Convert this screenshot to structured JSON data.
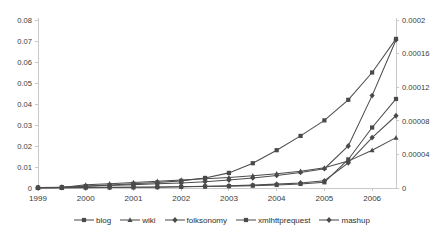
{
  "chart_data": {
    "type": "line",
    "title": "",
    "subtitle": "",
    "xlabel": "",
    "ylabel": "",
    "y2label": "",
    "grid": false,
    "legend_position": "bottom",
    "x": [
      1999,
      1999.5,
      2000,
      2000.5,
      2001,
      2001.5,
      2002,
      2002.5,
      2003,
      2003.5,
      2004,
      2004.5,
      2005,
      2005.5,
      2006,
      2006.5
    ],
    "xlim": [
      1999,
      2006.5
    ],
    "xticks": [
      1999,
      2000,
      2001,
      2002,
      2003,
      2004,
      2005,
      2006
    ],
    "xticklabels": [
      "1999",
      "2000",
      "2001",
      "2002",
      "2003",
      "2004",
      "2005",
      "2006"
    ],
    "ylim": [
      0,
      0.08
    ],
    "yticks": [
      0,
      0.01,
      0.02,
      0.03,
      0.04,
      0.05,
      0.06,
      0.07,
      0.08
    ],
    "yticklabels": [
      "0",
      "0.01",
      "0.02",
      "0.03",
      "0.04",
      "0.05",
      "0.06",
      "0.07",
      "0.08"
    ],
    "y2lim": [
      0,
      0.0002
    ],
    "y2ticks": [
      0,
      4e-05,
      8e-05,
      0.00012,
      0.00016,
      0.0002
    ],
    "y2ticklabels": [
      "0",
      "0.00004",
      "0.00008",
      "0.00012",
      "0.00016",
      "0.0002"
    ],
    "series": [
      {
        "name": "blog",
        "marker": "square",
        "axis": "left",
        "values": [
          0.0002,
          0.0004,
          0.0009,
          0.0014,
          0.002,
          0.0026,
          0.0034,
          0.0048,
          0.0072,
          0.0118,
          0.018,
          0.0248,
          0.0322,
          0.042,
          0.055,
          0.071
        ]
      },
      {
        "name": "wiki",
        "marker": "triangle",
        "axis": "left",
        "values": [
          0.0001,
          0.0002,
          0.0015,
          0.002,
          0.0026,
          0.0032,
          0.0038,
          0.0044,
          0.005,
          0.0058,
          0.0068,
          0.008,
          0.0096,
          0.0128,
          0.018,
          0.024
        ]
      },
      {
        "name": "folksonomy",
        "marker": "diamond",
        "axis": "right",
        "values": [
          2e-07,
          4e-07,
          6e-07,
          8e-07,
          1e-06,
          1.2e-06,
          1.6e-06,
          2e-06,
          2.6e-06,
          3.4e-06,
          4.6e-06,
          6e-06,
          8.6e-06,
          3e-05,
          6e-05,
          8.6e-05
        ]
      },
      {
        "name": "xmlhttprequest",
        "marker": "square",
        "axis": "right",
        "values": [
          1e-07,
          2e-07,
          4e-07,
          6e-07,
          8e-07,
          1e-06,
          1.4e-06,
          1.8e-06,
          2.2e-06,
          2.8e-06,
          3.6e-06,
          4.8e-06,
          6.8e-06,
          3.4e-05,
          7.2e-05,
          0.000106
        ]
      },
      {
        "name": "mashup",
        "marker": "diamond",
        "axis": "left",
        "values": [
          0.0002,
          0.0004,
          0.0008,
          0.0012,
          0.0016,
          0.002,
          0.0024,
          0.003,
          0.0038,
          0.0048,
          0.006,
          0.0074,
          0.0092,
          0.02,
          0.044,
          0.0705
        ]
      }
    ],
    "legend": [
      "blog",
      "wiki",
      "folksonomy",
      "xmlhttprequest",
      "mashup"
    ],
    "colors": {
      "series": "#4a4a4a",
      "axis": "#c9c9c9",
      "text": "#3a3a3a",
      "background": "#ffffff"
    }
  }
}
